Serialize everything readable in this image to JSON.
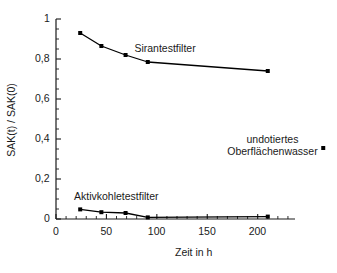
{
  "chart_data": {
    "type": "line",
    "title": "",
    "xlabel": "Zeit in h",
    "ylabel": "SAK(t) / SAK(0)",
    "xlim": [
      0,
      237
    ],
    "ylim": [
      0,
      1
    ],
    "xticks": [
      0,
      50,
      100,
      150,
      200
    ],
    "xtick_labels": [
      "0",
      "50",
      "100",
      "150",
      "200"
    ],
    "yticks": [
      0,
      0.2,
      0.4,
      0.6,
      0.8,
      1
    ],
    "ytick_labels": [
      "0",
      "0,2",
      "0,4",
      "0,6",
      "0,8",
      "1"
    ],
    "minor_tick_interval_x": 10,
    "minor_tick_interval_y": 0.05,
    "grid": false,
    "legend_position": "inline-annotations",
    "marker": "square",
    "marker_color": "#000000",
    "line_color": "#000000",
    "series": [
      {
        "name": "Sirantestfilter",
        "x": [
          24,
          45,
          69,
          91,
          210
        ],
        "values": [
          0.93,
          0.865,
          0.82,
          0.785,
          0.74
        ],
        "label_x": 108,
        "label_y": 0.855
      },
      {
        "name": "Aktivkohletestfilter",
        "x": [
          24,
          45,
          69,
          91,
          210
        ],
        "values": [
          0.048,
          0.034,
          0.03,
          0.008,
          0.012
        ],
        "label_x": 60,
        "label_y": 0.115
      }
    ],
    "annotations": [
      {
        "name": "undotiertes-oberflaechenwasser",
        "text_line1": "undotiertes",
        "text_line2": "Oberflächenwasser",
        "point_x": 265,
        "point_value": 0.355,
        "marker": "square"
      }
    ]
  },
  "axis": {
    "x_axis_name": "x-axis",
    "y_axis_name": "y-axis"
  }
}
